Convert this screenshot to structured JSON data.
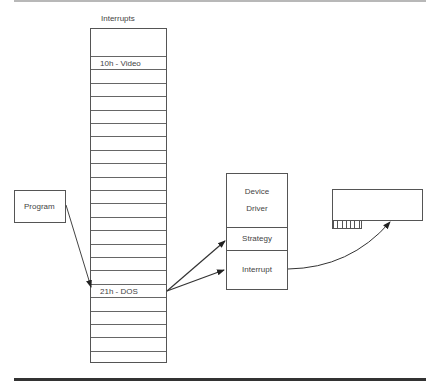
{
  "title": "Interrupts",
  "interrupt_table": {
    "label": "Interrupts",
    "row_count": 23,
    "entries": [
      {
        "row": 0,
        "label": "10h - Video"
      },
      {
        "row": 17,
        "label": "21h - DOS"
      }
    ]
  },
  "program": {
    "label": "Program"
  },
  "device_driver": {
    "header_line1": "Device",
    "header_line2": "Driver",
    "strategy_label": "Strategy",
    "interrupt_label": "Interrupt"
  },
  "hardware_card": {
    "name": "expansion-card",
    "connector_pins": 7
  },
  "colors": {
    "line": "#555555",
    "text": "#444444",
    "rule": "#333333"
  }
}
